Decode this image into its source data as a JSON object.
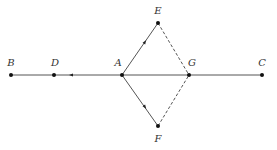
{
  "diagram": {
    "type": "geometry",
    "colors": {
      "line": "#555555",
      "point": "#111111",
      "label": "#333333",
      "background": "#ffffff"
    },
    "points": [
      {
        "id": "B",
        "label": "B",
        "x": 11,
        "y": 75,
        "label_x": 11,
        "label_y": 63
      },
      {
        "id": "D",
        "label": "D",
        "x": 54,
        "y": 75,
        "label_x": 55,
        "label_y": 63
      },
      {
        "id": "A",
        "label": "A",
        "x": 122,
        "y": 75,
        "label_x": 118,
        "label_y": 63
      },
      {
        "id": "G",
        "label": "G",
        "x": 189,
        "y": 75,
        "label_x": 192,
        "label_y": 63
      },
      {
        "id": "C",
        "label": "C",
        "x": 262,
        "y": 75,
        "label_x": 262,
        "label_y": 63
      },
      {
        "id": "E",
        "label": "E",
        "x": 158,
        "y": 23,
        "label_x": 158,
        "label_y": 11
      },
      {
        "id": "F",
        "label": "F",
        "x": 158,
        "y": 126,
        "label_x": 158,
        "label_y": 139
      }
    ],
    "segments": [
      {
        "from": "B",
        "to": "C",
        "style": "solid"
      },
      {
        "from": "A",
        "to": "E",
        "style": "solid"
      },
      {
        "from": "A",
        "to": "F",
        "style": "solid"
      },
      {
        "from": "E",
        "to": "G",
        "style": "dashed"
      },
      {
        "from": "F",
        "to": "G",
        "style": "dashed"
      }
    ],
    "arrows": [
      {
        "on": "D-A",
        "x": 71,
        "y": 75,
        "direction": "toward D"
      },
      {
        "on": "A-E",
        "x": 145,
        "y": 42,
        "direction": "toward E"
      },
      {
        "on": "A-F",
        "x": 145,
        "y": 107,
        "direction": "toward F"
      }
    ]
  }
}
